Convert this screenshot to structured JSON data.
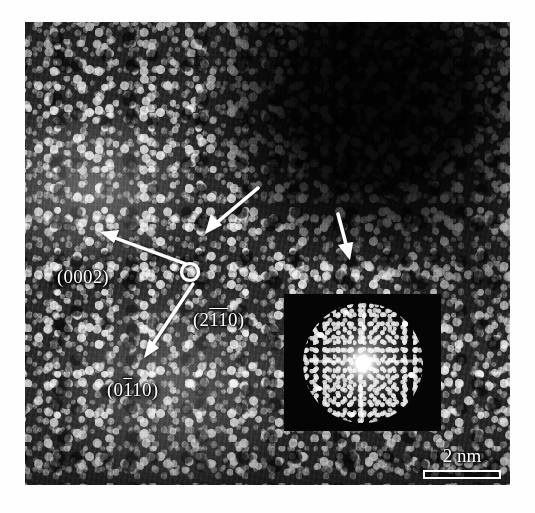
{
  "figure": {
    "type": "hrtem-micrograph",
    "background_color": "#ffffff",
    "image_area": {
      "x": 25,
      "y": 22,
      "width": 485,
      "height": 463
    }
  },
  "annotations": {
    "crystal_axes": {
      "origin_marker": "open-circle",
      "origin": {
        "x": 190,
        "y": 272
      },
      "arms": [
        {
          "name": "arm-0002",
          "label_plain": "(0002)",
          "label_parts": [
            {
              "text": "(0002)",
              "overbar": false
            }
          ],
          "label_position": {
            "x": 32,
            "y": 244
          },
          "tip": {
            "x": 100,
            "y": 236
          }
        },
        {
          "name": "arm-2110",
          "label_plain": "(2-1-10)",
          "label_parts": [
            {
              "text": "(2",
              "overbar": false
            },
            {
              "text": "11",
              "overbar": true
            },
            {
              "text": "0)",
              "overbar": false
            }
          ],
          "label_position": {
            "x": 168,
            "y": 287
          },
          "tip": null
        },
        {
          "name": "arm-0110",
          "label_plain": "(0-110)",
          "label_parts": [
            {
              "text": "(0",
              "overbar": false
            },
            {
              "text": "1",
              "overbar": true
            },
            {
              "text": "10)",
              "overbar": false
            }
          ],
          "label_position": {
            "x": 82,
            "y": 357
          },
          "tip": {
            "x": 146,
            "y": 356
          }
        }
      ]
    },
    "pointer_arrows": [
      {
        "name": "arrow-interface-left",
        "from": {
          "x": 257,
          "y": 188
        },
        "to": {
          "x": 204,
          "y": 233
        },
        "color": "#ffffff"
      },
      {
        "name": "arrow-interface-right",
        "from": {
          "x": 337,
          "y": 214
        },
        "to": {
          "x": 349,
          "y": 258
        },
        "color": "#ffffff"
      }
    ]
  },
  "fft_inset": {
    "name": "fft-diffractogram",
    "position": {
      "x": 259,
      "y": 272,
      "width": 157,
      "height": 137
    },
    "background_color": "#050505",
    "pattern_color": "#ffffff",
    "spikes": 4
  },
  "scale_bar": {
    "label": "2 nm",
    "value": 2,
    "unit": "nm",
    "bar_length_px": 78,
    "color": "#ffffff",
    "position": {
      "x": 393,
      "y": 424
    }
  },
  "colors": {
    "annotation": "#ffffff",
    "image_dark": "#0a0a0a",
    "image_light": "#e8e8e8",
    "page_background": "#ffffff"
  }
}
